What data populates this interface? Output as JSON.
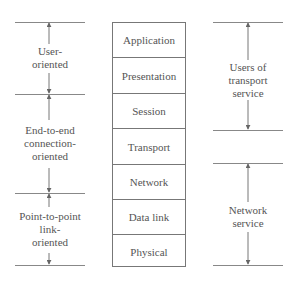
{
  "osi_stack": {
    "layers": [
      {
        "name": "Application"
      },
      {
        "name": "Presentation"
      },
      {
        "name": "Session"
      },
      {
        "name": "Transport"
      },
      {
        "name": "Network"
      },
      {
        "name": "Data link"
      },
      {
        "name": "Physical"
      }
    ]
  },
  "left_groups": [
    {
      "label": "User-\noriented"
    },
    {
      "label": "End-to-end\nconnection-\noriented"
    },
    {
      "label": "Point-to-point\nlink-\noriented"
    }
  ],
  "right_groups": [
    {
      "label": "Users of\ntransport\nservice"
    },
    {
      "label": "Network\nservice"
    }
  ],
  "colors": {
    "line": "#777777",
    "text": "#555555",
    "background": "#ffffff"
  }
}
